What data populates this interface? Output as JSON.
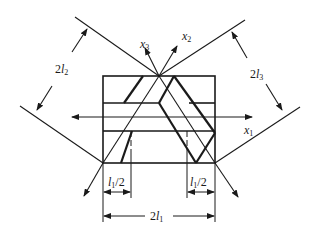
{
  "diagram": {
    "type": "crystal-plate-geometry",
    "colors": {
      "stroke": "#1a1a1a",
      "background": "#ffffff"
    },
    "axes": [
      {
        "id": "x1",
        "label": "x",
        "subscript": "1"
      },
      {
        "id": "x2",
        "label": "x",
        "subscript": "2"
      },
      {
        "id": "x3",
        "label": "x",
        "subscript": "3"
      }
    ],
    "dimensions": [
      {
        "id": "2l2",
        "prefix": "2",
        "var": "l",
        "subscript": "2"
      },
      {
        "id": "2l3",
        "prefix": "2",
        "var": "l",
        "subscript": "3"
      },
      {
        "id": "l1-half-left",
        "var": "l",
        "subscript": "1",
        "suffix": "/2"
      },
      {
        "id": "l1-half-right",
        "var": "l",
        "subscript": "1",
        "suffix": "/2"
      },
      {
        "id": "2l1",
        "prefix": "2",
        "var": "l",
        "subscript": "1"
      }
    ]
  }
}
